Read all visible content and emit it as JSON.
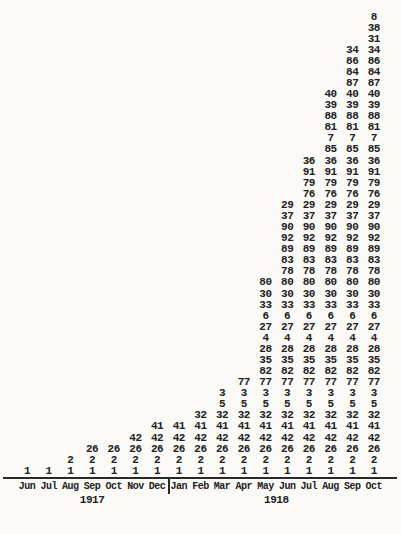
{
  "page": {
    "background_color": "#fbfaf7",
    "ink_color": "#222120"
  },
  "chart_data": {
    "type": "table",
    "title": "",
    "months": [
      "Jun",
      "Jul",
      "Aug",
      "Sep",
      "Oct",
      "Nov",
      "Dec",
      "Jan",
      "Feb",
      "Mar",
      "Apr",
      "May",
      "Jun",
      "Jul",
      "Aug",
      "Sep",
      "Oct"
    ],
    "years": [
      {
        "label": "1917",
        "first_col": 0,
        "last_col": 6
      },
      {
        "label": "1918",
        "first_col": 7,
        "last_col": 16
      }
    ],
    "rows_top_to_bottom": [
      {
        "value": "8",
        "start_col": 16
      },
      {
        "value": "38",
        "start_col": 16
      },
      {
        "value": "31",
        "start_col": 16
      },
      {
        "value": "34",
        "start_col": 15
      },
      {
        "value": "86",
        "start_col": 15
      },
      {
        "value": "84",
        "start_col": 15
      },
      {
        "value": "87",
        "start_col": 15
      },
      {
        "value": "40",
        "start_col": 14
      },
      {
        "value": "39",
        "start_col": 14
      },
      {
        "value": "88",
        "start_col": 14
      },
      {
        "value": "81",
        "start_col": 14
      },
      {
        "value": "7",
        "start_col": 14
      },
      {
        "value": "85",
        "start_col": 14
      },
      {
        "value": "36",
        "start_col": 13
      },
      {
        "value": "91",
        "start_col": 13
      },
      {
        "value": "79",
        "start_col": 13
      },
      {
        "value": "76",
        "start_col": 13
      },
      {
        "value": "29",
        "start_col": 12
      },
      {
        "value": "37",
        "start_col": 12
      },
      {
        "value": "90",
        "start_col": 12
      },
      {
        "value": "92",
        "start_col": 12
      },
      {
        "value": "89",
        "start_col": 12
      },
      {
        "value": "83",
        "start_col": 12
      },
      {
        "value": "78",
        "start_col": 12
      },
      {
        "value": "80",
        "start_col": 11
      },
      {
        "value": "30",
        "start_col": 11
      },
      {
        "value": "33",
        "start_col": 11
      },
      {
        "value": "6",
        "start_col": 11
      },
      {
        "value": "27",
        "start_col": 11
      },
      {
        "value": "4",
        "start_col": 11
      },
      {
        "value": "28",
        "start_col": 11
      },
      {
        "value": "35",
        "start_col": 11
      },
      {
        "value": "82",
        "start_col": 11
      },
      {
        "value": "77",
        "start_col": 10
      },
      {
        "value": "3",
        "start_col": 9
      },
      {
        "value": "5",
        "start_col": 9
      },
      {
        "value": "32",
        "start_col": 8
      },
      {
        "value": "41",
        "start_col": 6
      },
      {
        "value": "42",
        "start_col": 5
      },
      {
        "value": "26",
        "start_col": 3
      },
      {
        "value": "2",
        "start_col": 2
      },
      {
        "value": "1",
        "start_col": 0
      }
    ],
    "new_entries_by_month": {
      "Jun 1917": [
        "1"
      ],
      "Aug 1917": [
        "2"
      ],
      "Sep 1917": [
        "26"
      ],
      "Nov 1917": [
        "42"
      ],
      "Dec 1917": [
        "41"
      ],
      "Feb 1918": [
        "32"
      ],
      "Mar 1918": [
        "5",
        "3"
      ],
      "Apr 1918": [
        "77"
      ],
      "May 1918": [
        "82",
        "35",
        "28",
        "4",
        "27",
        "6",
        "33",
        "30",
        "80"
      ],
      "Jun 1918": [
        "78",
        "83",
        "89",
        "92",
        "90",
        "37",
        "29"
      ],
      "Jul 1918": [
        "76",
        "79",
        "91",
        "36"
      ],
      "Aug 1918": [
        "85",
        "7",
        "81",
        "88",
        "39",
        "40"
      ],
      "Sep 1918": [
        "87",
        "84",
        "86",
        "34"
      ],
      "Oct 1918": [
        "31",
        "38",
        "8"
      ]
    }
  }
}
